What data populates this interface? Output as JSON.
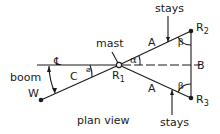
{
  "labels": {
    "mast": "mast",
    "stays_top": "stays",
    "stays_bottom": "stays",
    "boom": "boom",
    "w": "W",
    "c": "C",
    "centerline": "℄",
    "a_top": "A",
    "a_bottom": "A",
    "b": "B",
    "beta_top": "β",
    "beta_bottom": "β",
    "alpha": "α",
    "phi": "⌀",
    "r1": "R",
    "r1_sub": "1",
    "r2": "R",
    "r2_sub": "2",
    "r3": "R",
    "r3_sub": "3",
    "caption": "plan view"
  },
  "colors": {
    "line": "#1a1a1a",
    "background": "#ffffff"
  }
}
